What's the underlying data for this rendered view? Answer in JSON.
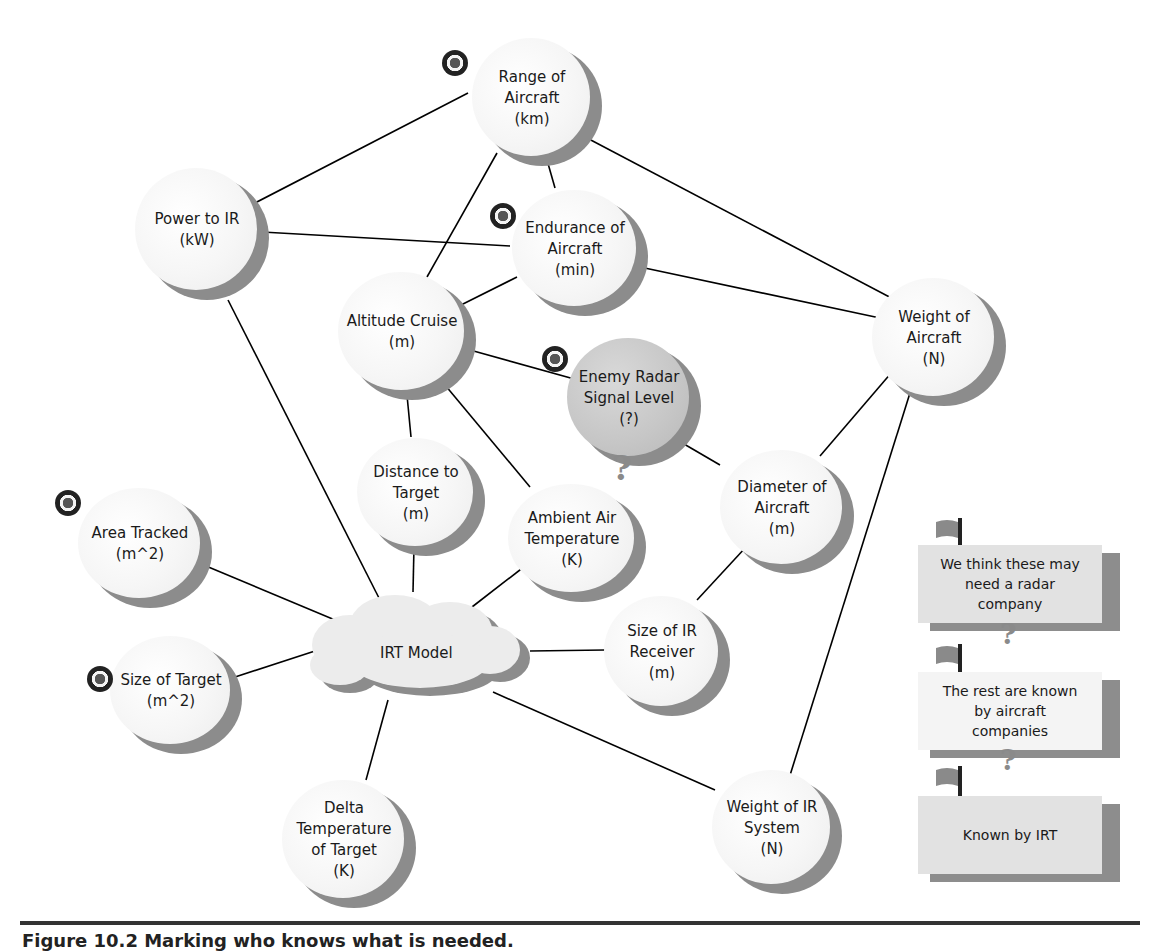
{
  "diagram": {
    "nodes": [
      {
        "id": "range",
        "lines": [
          "Range of",
          "Aircraft",
          "(km)"
        ],
        "target": true
      },
      {
        "id": "power",
        "lines": [
          "Power to IR",
          "(kW)"
        ],
        "target": false
      },
      {
        "id": "endurance",
        "lines": [
          "Endurance of",
          "Aircraft",
          "(min)"
        ],
        "target": true
      },
      {
        "id": "altitude",
        "lines": [
          "Altitude Cruise",
          "(m)"
        ],
        "target": false
      },
      {
        "id": "weight_aircraft",
        "lines": [
          "Weight of",
          "Aircraft",
          "(N)"
        ],
        "target": false
      },
      {
        "id": "enemy_radar",
        "lines": [
          "Enemy Radar",
          "Signal Level",
          "(?)"
        ],
        "target": true,
        "highlighted": true,
        "question": true
      },
      {
        "id": "distance",
        "lines": [
          "Distance to",
          "Target",
          "(m)"
        ],
        "target": false
      },
      {
        "id": "ambient",
        "lines": [
          "Ambient Air",
          "Temperature",
          "(K)"
        ],
        "target": false
      },
      {
        "id": "diameter",
        "lines": [
          "Diameter of",
          "Aircraft",
          "(m)"
        ],
        "target": false
      },
      {
        "id": "area",
        "lines": [
          "Area Tracked",
          "(m^2)"
        ],
        "target": true
      },
      {
        "id": "size_ir",
        "lines": [
          "Size of IR",
          "Receiver",
          "(m)"
        ],
        "target": false
      },
      {
        "id": "size_target",
        "lines": [
          "Size of Target",
          "(m^2)"
        ],
        "target": true
      },
      {
        "id": "delta_temp",
        "lines": [
          "Delta",
          "Temperature",
          "of Target",
          "(K)"
        ],
        "target": false
      },
      {
        "id": "weight_ir",
        "lines": [
          "Weight of IR",
          "System",
          "(N)"
        ],
        "target": false
      }
    ],
    "center": {
      "id": "irt_model",
      "label": "IRT Model"
    },
    "edges": [
      [
        "range",
        "power"
      ],
      [
        "range",
        "endurance"
      ],
      [
        "range",
        "altitude"
      ],
      [
        "range",
        "weight_aircraft"
      ],
      [
        "power",
        "endurance"
      ],
      [
        "power",
        "irt_model"
      ],
      [
        "endurance",
        "altitude"
      ],
      [
        "endurance",
        "weight_aircraft"
      ],
      [
        "altitude",
        "enemy_radar"
      ],
      [
        "altitude",
        "distance"
      ],
      [
        "altitude",
        "ambient"
      ],
      [
        "enemy_radar",
        "diameter"
      ],
      [
        "weight_aircraft",
        "diameter"
      ],
      [
        "weight_aircraft",
        "weight_ir"
      ],
      [
        "diameter",
        "size_ir"
      ],
      [
        "distance",
        "irt_model"
      ],
      [
        "ambient",
        "irt_model"
      ],
      [
        "area",
        "irt_model"
      ],
      [
        "size_ir",
        "irt_model"
      ],
      [
        "size_target",
        "irt_model"
      ],
      [
        "delta_temp",
        "irt_model"
      ],
      [
        "weight_ir",
        "irt_model"
      ]
    ]
  },
  "legend": {
    "items": [
      {
        "label": "We think these may need a radar company",
        "lines": [
          "We think these may",
          "need a radar",
          "company"
        ],
        "icon": "flag-icon",
        "question": true
      },
      {
        "label": "The rest are known by aircraft companies",
        "lines": [
          "The rest are known",
          "by aircraft",
          "companies"
        ],
        "icon": "flag-icon",
        "question": true
      },
      {
        "label": "Known by IRT",
        "lines": [
          "Known by IRT"
        ],
        "icon": "flag-icon",
        "question": false
      }
    ]
  },
  "markers": {
    "target_icon": "bullseye-icon",
    "question_icon": "question-mark-icon"
  },
  "caption": {
    "text": "Figure 10.2   Marking who knows what is needed."
  },
  "colors": {
    "line": "#000000",
    "node_face": "#f6f6f6",
    "node_shadow": "#8c8c8c",
    "highlight_face": "#c6c6c6",
    "banner_face": "#e2e2e2",
    "rule": "#333333"
  }
}
